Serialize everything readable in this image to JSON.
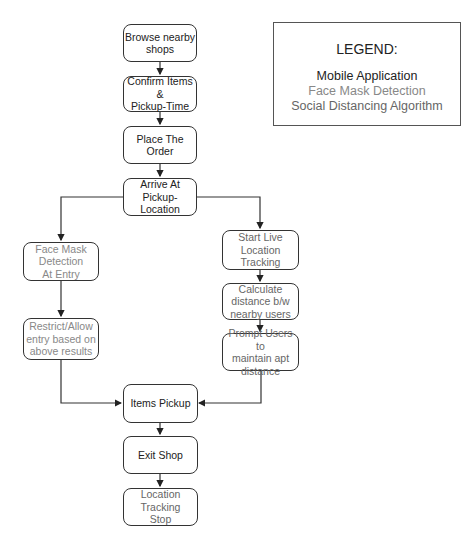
{
  "legend": {
    "title": "LEGEND:",
    "items": [
      {
        "label": "Mobile Application",
        "color": "#222222"
      },
      {
        "label": "Face Mask Detection",
        "color": "#888888"
      },
      {
        "label": "Social Distancing Algorithm",
        "color": "#666666"
      }
    ]
  },
  "nodes": {
    "browse": "Browse nearby\nshops",
    "confirm": "Confirm Items &\nPickup-Time",
    "place": "Place The Order",
    "arrive": "Arrive At Pickup-\nLocation",
    "face_mask": "Face Mask\nDetection\nAt Entry",
    "restrict": "Restrict/Allow\nentry based on\nabove results",
    "start_tracking": "Start Live\nLocation Tracking",
    "calculate": "Calculate\ndistance b/w\nnearby users",
    "prompt": "Prompt Users to\nmaintain apt\ndistance",
    "pickup": "Items Pickup",
    "exit": "Exit Shop",
    "stop": "Location Tracking\nStop"
  }
}
